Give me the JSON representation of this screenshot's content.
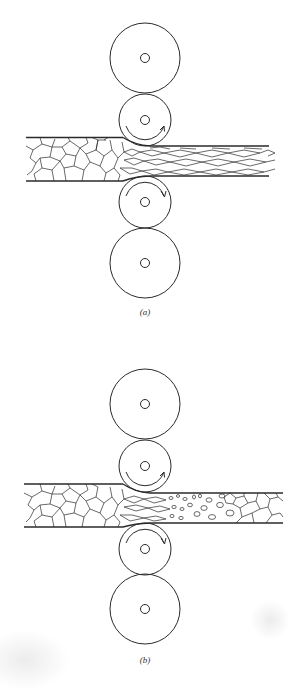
{
  "figure": {
    "panels": [
      {
        "id": "a",
        "label": "(a)",
        "description": "Cold rolling: equiaxed grains elongated in rolling direction",
        "rolls": [
          "backup-roll-top",
          "work-roll-top",
          "work-roll-bottom",
          "backup-roll-bottom"
        ],
        "outgoing_grain_structure": "elongated"
      },
      {
        "id": "b",
        "label": "(b)",
        "description": "Hot rolling: deformed grains recrystallize into new equiaxed grains",
        "rolls": [
          "backup-roll-top",
          "work-roll-top",
          "work-roll-bottom",
          "backup-roll-bottom"
        ],
        "outgoing_grain_structure": "recrystallized"
      }
    ],
    "colors": {
      "line": "#2a2a2a",
      "background": "#ffffff"
    }
  }
}
